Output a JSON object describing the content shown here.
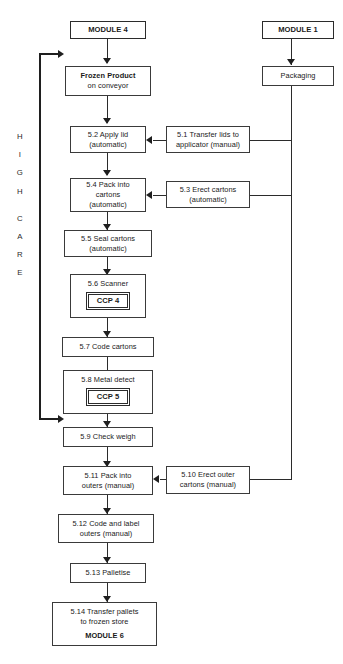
{
  "diagram": {
    "zone_label": {
      "letters": [
        "H",
        "I",
        "G",
        "H",
        "",
        "C",
        "A",
        "R",
        "E"
      ],
      "text": "HIGH CARE"
    },
    "colors": {
      "stroke": "#2b2b2b",
      "arrow": "#1f1f1f",
      "background": "#ffffff"
    }
  },
  "nodes": {
    "module4": {
      "lines": [
        "MODULE 4"
      ]
    },
    "module1": {
      "lines": [
        "MODULE 1"
      ]
    },
    "packaging": {
      "lines": [
        "Packaging"
      ]
    },
    "frozen": {
      "lines": [
        "Frozen Product",
        "on conveyor"
      ]
    },
    "s52": {
      "lines": [
        "5.2 Apply lid",
        "(automatic)"
      ]
    },
    "s51": {
      "lines": [
        "5.1 Transfer lids to",
        "applicator (manual)"
      ]
    },
    "s54": {
      "lines": [
        "5.4 Pack into",
        "cartons",
        "(automatic)"
      ]
    },
    "s53": {
      "lines": [
        "5.3 Erect cartons",
        "(automatic)"
      ]
    },
    "s55": {
      "lines": [
        "5.5 Seal cartons",
        "(automatic)"
      ]
    },
    "s56": {
      "lines": [
        "5.6 Scanner"
      ],
      "ccp": "CCP 4"
    },
    "s57": {
      "lines": [
        "5.7 Code cartons"
      ]
    },
    "s58": {
      "lines": [
        "5.8 Metal detect"
      ],
      "ccp": "CCP 5"
    },
    "s59": {
      "lines": [
        "5.9 Check weigh"
      ]
    },
    "s511": {
      "lines": [
        "5.11 Pack into",
        "outers (manual)"
      ]
    },
    "s510": {
      "lines": [
        "5.10 Erect outer",
        "cartons (manual)"
      ]
    },
    "s512": {
      "lines": [
        "5.12 Code and label",
        "outers (manual)"
      ]
    },
    "s513": {
      "lines": [
        "5.13 Palletise"
      ]
    },
    "s514": {
      "lines": [
        "5.14 Transfer pallets",
        "to frozen store",
        "MODULE 6"
      ]
    }
  }
}
